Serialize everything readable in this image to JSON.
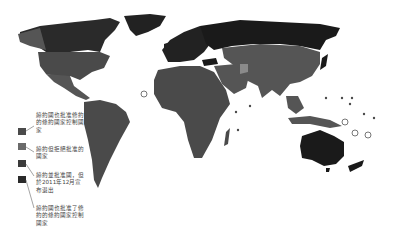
{
  "map": {
    "title": "Kyoto Protocol participation world map",
    "colors": {
      "background": "#ffffff",
      "ratified_binding": "#1a1a1a",
      "ratified_no_binding": "#555555",
      "signed_not_ratified": "#8a8a8a",
      "withdrew": "#222222",
      "borders": "#777777"
    }
  },
  "legend": {
    "items": [
      {
        "label": "締約國也批准修約的條約國家控制國家",
        "color": "#4a4a4a"
      },
      {
        "label": "締約但拒絕批准的國家",
        "color": "#6a6a6a"
      },
      {
        "label": "締約並批准國，但於2011年12月宣布退出",
        "color": "#3a3a3a"
      },
      {
        "label": "締約國也批准了修約的條約國家控制國家",
        "color": "#2a2a2a"
      }
    ]
  }
}
